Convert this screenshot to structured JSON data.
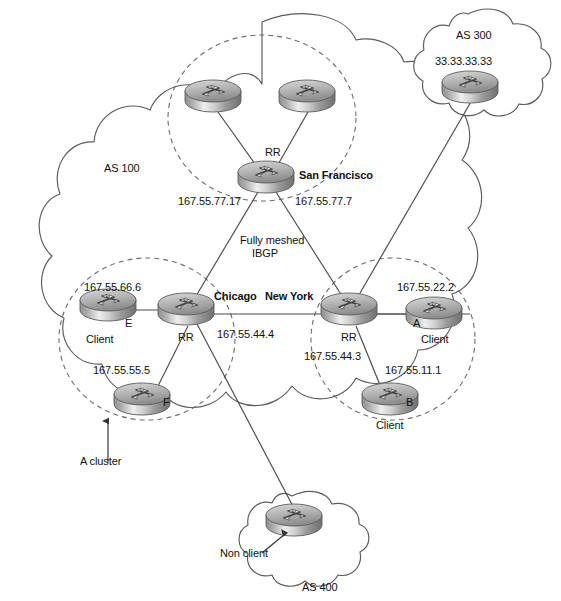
{
  "diagram": {
    "type": "network-topology"
  },
  "autonomous_systems": [
    {
      "id": "as100",
      "label": "AS 100",
      "shape": "cloud"
    },
    {
      "id": "as300",
      "label": "AS 300",
      "shape": "cloud"
    },
    {
      "id": "as400",
      "label": "AS 400",
      "shape": "cloud"
    }
  ],
  "labels": {
    "as100": "AS 100",
    "as300": "AS 300",
    "as300_ip": "33.33.33.33",
    "as400": "AS 400",
    "non_client": "Non client",
    "a_cluster": "A cluster",
    "fully_meshed": "Fully meshed",
    "ibgp": "IBGP",
    "rr_sf": "RR",
    "rr_chicago": "RR",
    "rr_newyork": "RR",
    "san_francisco": "San Francisco",
    "chicago": "Chicago",
    "new_york": "New York",
    "ip_sf_left": "167.55.77.17",
    "ip_sf_right": "167.55.77.7",
    "ip_chicago": "167.55.44.4",
    "ip_newyork": "167.55.44.3",
    "ip_e": "167.55.66.6",
    "ip_f": "167.55.55.5",
    "ip_a": "167.55.22.2",
    "ip_b": "167.55.11.1",
    "router_e": "E",
    "router_f": "F",
    "router_a": "A",
    "router_b": "B",
    "client_e": "Client",
    "client_f": "Client",
    "client_a": "Client",
    "client_b": "Client"
  },
  "routers": [
    {
      "id": "sf-top-left",
      "x": 213,
      "y": 95,
      "role": "ibgp-peer",
      "cluster": "san-francisco"
    },
    {
      "id": "sf-top-right",
      "x": 307,
      "y": 95,
      "role": "ibgp-peer",
      "cluster": "san-francisco"
    },
    {
      "id": "sf-rr",
      "x": 266,
      "y": 176,
      "role": "route-reflector",
      "label": "San Francisco",
      "rr": "RR"
    },
    {
      "id": "chicago-rr",
      "x": 186,
      "y": 308,
      "role": "route-reflector",
      "label": "Chicago",
      "rr": "RR",
      "ip": "167.55.44.4"
    },
    {
      "id": "newyork-rr",
      "x": 349,
      "y": 308,
      "role": "route-reflector",
      "label": "New York",
      "rr": "RR",
      "ip": "167.55.44.3"
    },
    {
      "id": "client-e",
      "x": 108,
      "y": 304,
      "role": "client",
      "name": "E",
      "ip": "167.55.66.6"
    },
    {
      "id": "client-f",
      "x": 142,
      "y": 398,
      "role": "client",
      "name": "F",
      "ip": "167.55.55.5"
    },
    {
      "id": "client-a",
      "x": 434,
      "y": 312,
      "role": "client",
      "name": "A",
      "ip": "167.55.22.2"
    },
    {
      "id": "client-b",
      "x": 390,
      "y": 398,
      "role": "client",
      "name": "B",
      "ip": "167.55.11.1"
    },
    {
      "id": "as300-router",
      "x": 470,
      "y": 86,
      "role": "external-peer",
      "ip": "33.33.33.33"
    },
    {
      "id": "as400-router",
      "x": 294,
      "y": 519,
      "role": "non-client"
    }
  ],
  "clusters": [
    {
      "id": "sf-cluster",
      "cx": 262,
      "cy": 118,
      "rx": 94,
      "ry": 83,
      "style": "dashed"
    },
    {
      "id": "chicago-cluster",
      "cx": 147,
      "cy": 339,
      "rx": 88,
      "ry": 81,
      "style": "dashed"
    },
    {
      "id": "newyork-cluster",
      "cx": 393,
      "cy": 339,
      "rx": 82,
      "ry": 81,
      "style": "dashed"
    }
  ],
  "links": [
    {
      "from": "sf-top-left",
      "to": "sf-rr"
    },
    {
      "from": "sf-top-right",
      "to": "sf-rr"
    },
    {
      "from": "sf-rr",
      "to": "chicago-rr"
    },
    {
      "from": "sf-rr",
      "to": "newyork-rr"
    },
    {
      "from": "chicago-rr",
      "to": "newyork-rr"
    },
    {
      "from": "client-e",
      "to": "chicago-rr"
    },
    {
      "from": "client-f",
      "to": "chicago-rr"
    },
    {
      "from": "client-a",
      "to": "newyork-rr"
    },
    {
      "from": "client-b",
      "to": "newyork-rr"
    },
    {
      "from": "as300-router",
      "to": "newyork-rr"
    },
    {
      "from": "chicago-rr",
      "to": "as400-router"
    }
  ],
  "colors": {
    "line": "#4a4a4a",
    "cloud_outline": "#5a5a5a",
    "dashed": "#6b6b6b",
    "router_body_light": "#f2f2f2",
    "router_body_dark": "#8e8e8e",
    "text": "#111111"
  }
}
